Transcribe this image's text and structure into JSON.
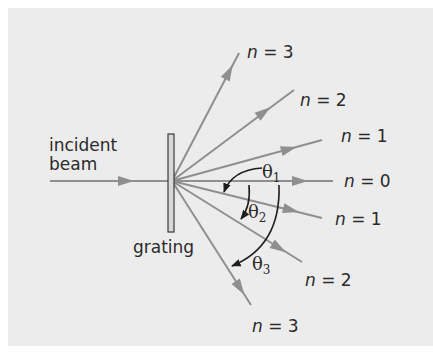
{
  "diagram": {
    "labels": {
      "incident_line1": "incident",
      "incident_line2": "beam",
      "grating": "grating"
    },
    "orders": [
      {
        "id": "up3",
        "n_label": "n",
        "eq": " = 3"
      },
      {
        "id": "up2",
        "n_label": "n",
        "eq": " = 2"
      },
      {
        "id": "up1",
        "n_label": "n",
        "eq": " = 1"
      },
      {
        "id": "zero",
        "n_label": "n",
        "eq": " = 0"
      },
      {
        "id": "down1",
        "n_label": "n",
        "eq": " = 1"
      },
      {
        "id": "down2",
        "n_label": "n",
        "eq": " = 2"
      },
      {
        "id": "down3",
        "n_label": "n",
        "eq": " = 3"
      }
    ],
    "angles": [
      {
        "symbol": "θ",
        "sub": "1"
      },
      {
        "symbol": "θ",
        "sub": "2"
      },
      {
        "symbol": "θ",
        "sub": "3"
      }
    ],
    "colors": {
      "background": "#ececec",
      "ray": "#8f8f8f",
      "arc": "#1e1e1e",
      "text": "#2a2a2a"
    }
  }
}
